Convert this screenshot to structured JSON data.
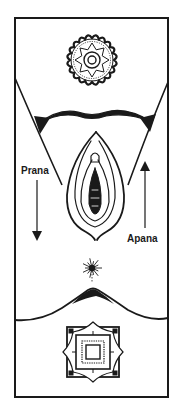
{
  "diagram": {
    "title": "",
    "colors": {
      "ink": "#1a1a1a",
      "background": "#ffffff"
    },
    "labels": {
      "prana": "Prana",
      "apana": "Apana"
    },
    "arrows": [
      {
        "label": "Prana",
        "direction": "down"
      },
      {
        "label": "Apana",
        "direction": "up"
      }
    ],
    "symbols": [
      {
        "name": "crown-lotus-chakra",
        "shape": "circular lotus mandala"
      },
      {
        "name": "yoni",
        "shape": "almond outline"
      },
      {
        "name": "bindu-star",
        "shape": "radiating star burst"
      },
      {
        "name": "root-square-chakra",
        "shape": "square mandala with petals"
      }
    ]
  }
}
